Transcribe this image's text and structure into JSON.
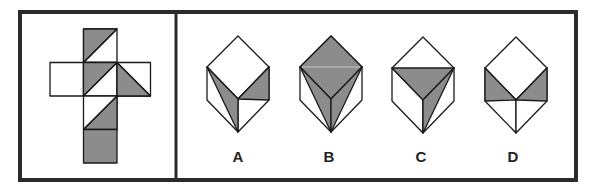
{
  "puzzle": {
    "type": "cube-net-folding",
    "colors": {
      "frame": "#2b2b2b",
      "stroke": "#1a1a1a",
      "shade": "#8c8c8c",
      "face": "#ffffff"
    },
    "net": {
      "layout": "cross-3x4",
      "faces": [
        {
          "id": "top",
          "row": 0,
          "col": 1,
          "shading": "upper-left-triangle",
          "diagonal": "bl-tr"
        },
        {
          "id": "left",
          "row": 1,
          "col": 0,
          "shading": "none"
        },
        {
          "id": "center",
          "row": 1,
          "col": 1,
          "shading": "upper-left-triangle",
          "diagonal": "bl-tr"
        },
        {
          "id": "right",
          "row": 1,
          "col": 2,
          "shading": "lower-left-triangle",
          "diagonal": "tl-br"
        },
        {
          "id": "lower",
          "row": 2,
          "col": 1,
          "shading": "lower-right-triangle",
          "diagonal": "bl-tr"
        },
        {
          "id": "bottom",
          "row": 3,
          "col": 1,
          "shading": "full"
        }
      ]
    },
    "options": [
      {
        "label": "A",
        "top_face": "blank",
        "left_face": "gray triangle from top-left corner to bottom vertex along inner edge",
        "right_face": "gray triangle in upper part, below right corner"
      },
      {
        "label": "B",
        "top_face": "full gray",
        "left_face": "gray triangle along inner edge",
        "right_face": "gray triangle along inner edge"
      },
      {
        "label": "C",
        "top_face": "gray lower half (triangle left-right-center)",
        "left_face": "blank",
        "right_face": "gray triangle along inner edge"
      },
      {
        "label": "D",
        "top_face": "blank",
        "left_face": "gray upper triangle",
        "right_face": "gray upper triangle"
      }
    ]
  }
}
